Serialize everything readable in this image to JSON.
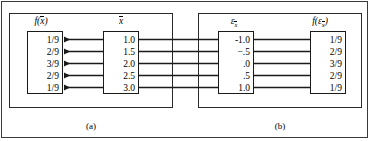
{
  "figure": {
    "type": "mapping-diagram",
    "panels": [
      {
        "id": "a",
        "caption": "(a)",
        "columns": [
          {
            "id": "f-xbar",
            "header": "f(x̄)",
            "header_parts": {
              "func": "f",
              "open": "(",
              "var": "x",
              "close": ")"
            },
            "align": "right",
            "values": [
              "1/9",
              "2/9",
              "3/9",
              "2/9",
              "1/9"
            ]
          },
          {
            "id": "xbar",
            "header": "x̄",
            "header_parts": {
              "func": "",
              "open": "",
              "var": "x",
              "close": ""
            },
            "align": "right",
            "values": [
              "1.0",
              "1.5",
              "2.0",
              "2.5",
              "3.0"
            ]
          }
        ],
        "arrow_direction": "left"
      },
      {
        "id": "b",
        "caption": "(b)",
        "columns": [
          {
            "id": "epsilon-xbar",
            "header": "εx̄",
            "header_parts": {
              "func": "",
              "open": "",
              "var": "ε",
              "sub": "x",
              "close": ""
            },
            "align": "right",
            "values": [
              "-1.0",
              "−.5",
              ".0",
              ".5",
              "1.0"
            ]
          },
          {
            "id": "f-epsilon-xbar",
            "header": "f(εx̄)",
            "header_parts": {
              "func": "f",
              "open": "(",
              "var": "ε",
              "sub": "x",
              "close": ")"
            },
            "align": "right",
            "values": [
              "1/9",
              "2/9",
              "3/9",
              "2/9",
              "1/9"
            ]
          }
        ],
        "arrow_direction": "right"
      }
    ],
    "row_count": 5,
    "colors": {
      "line": "#1a1a1a",
      "frame": "#3a3a3a",
      "background": "#ffffff",
      "text": "#000000"
    }
  }
}
